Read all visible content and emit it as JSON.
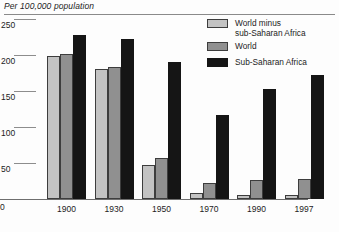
{
  "header": {
    "unit_label": "Per 100,000 population"
  },
  "legend": {
    "position": "top-right",
    "entries": [
      {
        "label_line1": "World minus",
        "label_line2": "sub-Saharan Africa",
        "color": "#c3c3c3"
      },
      {
        "label_line1": "World",
        "label_line2": "",
        "color": "#909090"
      },
      {
        "label_line1": "Sub-Saharan Africa",
        "label_line2": "",
        "color": "#151515"
      }
    ]
  },
  "axes": {
    "y_ticks": [
      "250",
      "200",
      "150",
      "100",
      "50",
      "0"
    ],
    "x_ticks": [
      "1900",
      "1930",
      "1950",
      "1970",
      "1990",
      "1997"
    ]
  },
  "chart_data": {
    "type": "bar",
    "title": "",
    "subtitle": "",
    "xlabel": "",
    "ylabel": "Per 100,000 population",
    "ylim": [
      0,
      250
    ],
    "ytick_values": [
      0,
      50,
      100,
      150,
      200,
      250
    ],
    "grid": false,
    "legend_position": "top-right",
    "categories": [
      "1900",
      "1930",
      "1950",
      "1970",
      "1990",
      "1997"
    ],
    "series": [
      {
        "name": "World minus sub-Saharan Africa",
        "color": "#c3c3c3",
        "values": [
          198,
          180,
          47,
          9,
          5,
          5
        ]
      },
      {
        "name": "World",
        "color": "#909090",
        "values": [
          202,
          183,
          57,
          22,
          27,
          28
        ]
      },
      {
        "name": "Sub-Saharan Africa",
        "color": "#151515",
        "values": [
          228,
          222,
          190,
          117,
          153,
          172
        ]
      }
    ]
  }
}
